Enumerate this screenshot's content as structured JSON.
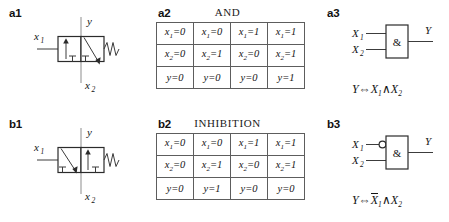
{
  "figure": {
    "panels": {
      "a1": {
        "label": "a1"
      },
      "a2": {
        "label": "a2",
        "title": "AND"
      },
      "a3": {
        "label": "a3"
      },
      "b1": {
        "label": "b1"
      },
      "b2": {
        "label": "b2",
        "title": "INHIBITION"
      },
      "b3": {
        "label": "b3"
      }
    }
  },
  "valve_a1": {
    "port_x1": "x",
    "port_x1_sub": "1",
    "port_y": "y",
    "port_x2": "x",
    "port_x2_sub": "2"
  },
  "valve_b1": {
    "port_x1": "x",
    "port_x1_sub": "1",
    "port_y": "y",
    "port_x2": "x",
    "port_x2_sub": "2"
  },
  "truth_table_and": {
    "title": "AND",
    "rows": [
      {
        "var": "x",
        "sub": "1",
        "values": [
          "0",
          "0",
          "1",
          "1"
        ]
      },
      {
        "var": "x",
        "sub": "2",
        "values": [
          "0",
          "1",
          "0",
          "1"
        ]
      },
      {
        "var": "y",
        "sub": "",
        "values": [
          "0",
          "0",
          "0",
          "1"
        ]
      }
    ]
  },
  "truth_table_inhibition": {
    "title": "INHIBITION",
    "rows": [
      {
        "var": "x",
        "sub": "1",
        "values": [
          "0",
          "0",
          "1",
          "1"
        ]
      },
      {
        "var": "x",
        "sub": "2",
        "values": [
          "0",
          "1",
          "0",
          "1"
        ]
      },
      {
        "var": "y",
        "sub": "",
        "values": [
          "0",
          "1",
          "0",
          "0"
        ]
      }
    ]
  },
  "gate_a3": {
    "input_1": "X",
    "input_1_sub": "1",
    "input_2": "X",
    "input_2_sub": "2",
    "body_symbol": "&",
    "output": "Y",
    "negated_input": false,
    "formula": {
      "lhs": "Y",
      "equiv": "⇔",
      "arg1": "X",
      "arg1_sub": "1",
      "arg1_negated": false,
      "conj": "∧",
      "arg2": "X",
      "arg2_sub": "2"
    }
  },
  "gate_b3": {
    "input_1": "X",
    "input_1_sub": "1",
    "input_2": "X",
    "input_2_sub": "2",
    "body_symbol": "&",
    "output": "Y",
    "negated_input": true,
    "formula": {
      "lhs": "Y",
      "equiv": "⇔",
      "arg1": "X",
      "arg1_sub": "1",
      "arg1_negated": true,
      "conj": "∧",
      "arg2": "X",
      "arg2_sub": "2"
    }
  },
  "colors": {
    "line": "#3c3c3c",
    "box": "#2b2b2b",
    "axis": "#8d8d8d",
    "text": "#141414",
    "background": "#ffffff"
  }
}
